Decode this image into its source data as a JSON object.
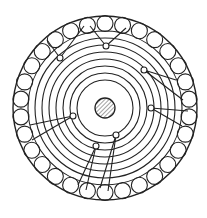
{
  "diagram": {
    "type": "cross-section",
    "colors": {
      "stroke": "#222222",
      "background": "#ffffff",
      "hatch": "#444444"
    },
    "center": [
      105,
      108
    ],
    "outer_radius": 92,
    "ring_inner_radius": 77,
    "peripheral_circle_radius": 8,
    "peripheral_circle_orbit": 84.5,
    "peripheral_circle_count": 30,
    "concentric_radii": [
      70,
      63,
      56,
      49,
      42,
      35,
      28
    ],
    "core_radius": 10,
    "core_pattern": "hatched",
    "leads": [
      {
        "node": [
          60,
          58
        ],
        "to": [
          [
            47,
            40
          ],
          [
            84,
            26
          ]
        ]
      },
      {
        "node": [
          106,
          46
        ],
        "to": [
          [
            126,
            28
          ],
          [
            90,
            26
          ]
        ]
      },
      {
        "node": [
          144,
          70
        ],
        "to": [
          [
            183,
            100
          ],
          [
            176,
            80
          ]
        ]
      },
      {
        "node": [
          151,
          108
        ],
        "to": [
          [
            188,
            111
          ],
          [
            182,
            126
          ]
        ]
      },
      {
        "node": [
          73,
          116
        ],
        "to": [
          [
            30,
            125
          ],
          [
            32,
            140
          ]
        ]
      },
      {
        "node": [
          96,
          146
        ],
        "to": [
          [
            86,
            190
          ],
          [
            78,
            185
          ]
        ]
      },
      {
        "node": [
          116,
          135
        ],
        "to": [
          [
            108,
            191
          ],
          [
            100,
            188
          ]
        ]
      }
    ]
  }
}
